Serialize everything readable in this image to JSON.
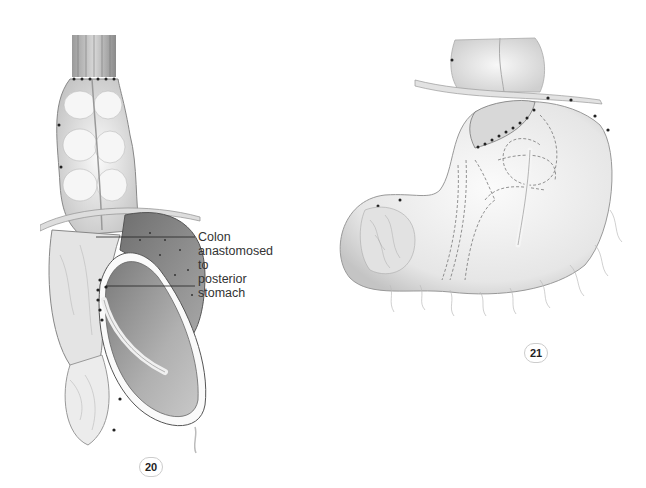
{
  "figures": [
    {
      "id": "figure-20",
      "number": "20",
      "description": "Colon interposition anastomosed to posterior stomach",
      "labels": [
        {
          "text": "Colon"
        },
        {
          "text": "anastomosed"
        },
        {
          "text": "to"
        },
        {
          "text": "posterior"
        },
        {
          "text": "stomach"
        }
      ]
    },
    {
      "id": "figure-21",
      "number": "21",
      "description": "Stomach with colon anastomosis, dashed outlines showing internal structures"
    }
  ],
  "colors": {
    "background": "#ffffff",
    "tissue_light": "#e8e8e8",
    "tissue_mid": "#b8b8b8",
    "tissue_dark": "#8a8a8a",
    "outline": "#555555",
    "suture": "#222222"
  }
}
